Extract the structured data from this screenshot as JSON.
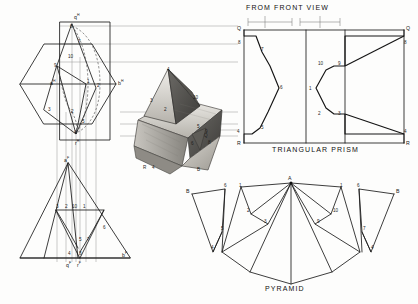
{
  "plate": {
    "title_front_view": "FROM FRONT VIEW",
    "caption_prism": "TRIANGULAR PRISM",
    "caption_pyramid": "PYRAMID"
  },
  "top_view": {
    "name": "horizontal-projection-hexagon",
    "labels": [
      {
        "text": "q",
        "sup": "H",
        "x": 74,
        "y": 16
      },
      {
        "text": "a",
        "sup": "H",
        "x": 53,
        "y": 82
      },
      {
        "text": "b",
        "sup": "H",
        "x": 116,
        "y": 82
      },
      {
        "text": "r",
        "sup": "H",
        "x": 77,
        "y": 140
      }
    ],
    "points": [
      {
        "n": "8",
        "x": 72,
        "y": 24
      },
      {
        "n": "7",
        "x": 79,
        "y": 42
      },
      {
        "n": "10",
        "x": 72,
        "y": 57
      },
      {
        "n": "9",
        "x": 57,
        "y": 66
      },
      {
        "n": "1",
        "x": 86,
        "y": 84
      },
      {
        "n": "2",
        "x": 96,
        "y": 88
      },
      {
        "n": "3",
        "x": 50,
        "y": 110
      },
      {
        "n": "2b",
        "x": 72,
        "y": 112
      },
      {
        "n": "5",
        "x": 83,
        "y": 122
      },
      {
        "n": "4",
        "x": 76,
        "y": 134
      }
    ]
  },
  "front_view": {
    "name": "frontal-projection",
    "labels": [
      {
        "text": "a",
        "sup": "F",
        "x": 65,
        "y": 161
      },
      {
        "text": "b",
        "sup": "F",
        "x": 121,
        "y": 256
      },
      {
        "text": "q",
        "sup": "F",
        "x": 68,
        "y": 266
      },
      {
        "text": "r",
        "sup": "F",
        "x": 79,
        "y": 266
      }
    ],
    "points": [
      {
        "n": "3",
        "x": 58,
        "y": 207
      },
      {
        "n": "2",
        "x": 67,
        "y": 206
      },
      {
        "n": "10",
        "x": 75,
        "y": 206
      },
      {
        "n": "1",
        "x": 84,
        "y": 206
      },
      {
        "n": "6",
        "x": 102,
        "y": 228
      },
      {
        "n": "5",
        "x": 80,
        "y": 240
      },
      {
        "n": "7",
        "x": 88,
        "y": 240
      },
      {
        "n": "4",
        "x": 70,
        "y": 254
      },
      {
        "n": "8",
        "x": 80,
        "y": 254
      }
    ]
  },
  "model_photo": {
    "name": "pyramid-prism-model-photograph",
    "alt": "photograph of cardboard model: square pyramid piercing a triangular prism",
    "points": [
      {
        "n": "4",
        "x": 168,
        "y": 71
      },
      {
        "n": "3",
        "x": 152,
        "y": 101
      },
      {
        "n": "2",
        "x": 165,
        "y": 110
      },
      {
        "n": "10",
        "x": 194,
        "y": 98
      },
      {
        "n": "5",
        "x": 198,
        "y": 127
      },
      {
        "n": "9",
        "x": 206,
        "y": 132
      },
      {
        "n": "Q",
        "x": 205,
        "y": 136
      },
      {
        "n": "8",
        "x": 209,
        "y": 143
      },
      {
        "n": "6",
        "x": 192,
        "y": 144
      },
      {
        "n": "R",
        "x": 144,
        "y": 168
      },
      {
        "n": "4b",
        "x": 153,
        "y": 168
      },
      {
        "n": "B",
        "x": 198,
        "y": 170
      }
    ]
  },
  "prism_development": {
    "name": "triangular-prism-pattern",
    "corner_labels": [
      {
        "text": "Q",
        "x": 238,
        "y": 29
      },
      {
        "text": "Q",
        "x": 400,
        "y": 29
      },
      {
        "text": "R",
        "x": 238,
        "y": 144
      },
      {
        "text": "R",
        "x": 400,
        "y": 144
      }
    ],
    "points": [
      {
        "n": "8",
        "x": 239,
        "y": 44
      },
      {
        "n": "7",
        "x": 262,
        "y": 50
      },
      {
        "n": "6",
        "x": 281,
        "y": 89
      },
      {
        "n": "5",
        "x": 262,
        "y": 129
      },
      {
        "n": "4",
        "x": 239,
        "y": 134
      },
      {
        "n": "10",
        "x": 320,
        "y": 64
      },
      {
        "n": "9",
        "x": 339,
        "y": 64
      },
      {
        "n": "1",
        "x": 310,
        "y": 89
      },
      {
        "n": "2",
        "x": 320,
        "y": 114
      },
      {
        "n": "3",
        "x": 339,
        "y": 114
      },
      {
        "n": "8r",
        "x": 401,
        "y": 44
      },
      {
        "n": "4r",
        "x": 401,
        "y": 134
      }
    ]
  },
  "pyramid_development": {
    "name": "pyramid-pattern",
    "apex": {
      "text": "A",
      "x": 290,
      "y": 180
    },
    "side_labels": [
      {
        "text": "B",
        "x": 190,
        "y": 192
      },
      {
        "text": "B",
        "x": 398,
        "y": 192
      }
    ],
    "points": [
      {
        "n": "6",
        "x": 225,
        "y": 186
      },
      {
        "n": "1",
        "x": 240,
        "y": 186
      },
      {
        "n": "1",
        "x": 341,
        "y": 186
      },
      {
        "n": "6",
        "x": 358,
        "y": 186
      },
      {
        "n": "2",
        "x": 248,
        "y": 211
      },
      {
        "n": "10",
        "x": 334,
        "y": 211
      },
      {
        "n": "3",
        "x": 265,
        "y": 222
      },
      {
        "n": "9",
        "x": 318,
        "y": 222
      },
      {
        "n": "5",
        "x": 222,
        "y": 229
      },
      {
        "n": "7",
        "x": 364,
        "y": 229
      },
      {
        "n": "4",
        "x": 213,
        "y": 248
      },
      {
        "n": "4",
        "x": 372,
        "y": 248
      }
    ]
  },
  "dimension_bar": {
    "name": "from-front-view-dimension-ticks",
    "segments": 4
  }
}
